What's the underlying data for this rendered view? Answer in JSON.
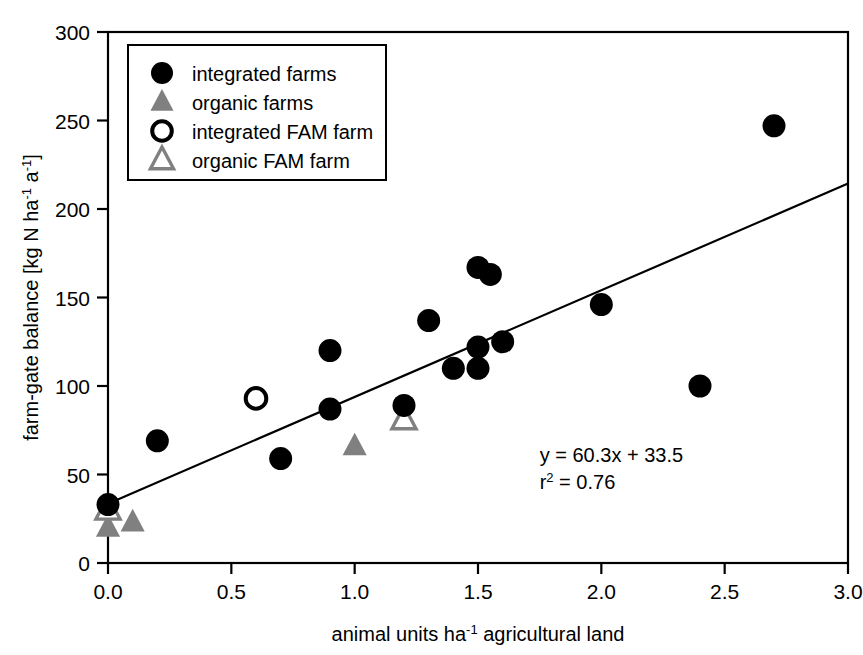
{
  "chart_data": {
    "type": "scatter",
    "title": "",
    "xlabel": "animal units ha⁻¹ agricultural land",
    "ylabel": "farm-gate balance [kg N ha⁻¹ a⁻¹]",
    "xlim": [
      0.0,
      3.0
    ],
    "ylim": [
      0,
      300
    ],
    "xticks": [
      "0.0",
      "0.5",
      "1.0",
      "1.5",
      "2.0",
      "2.5",
      "3.0"
    ],
    "xtick_values": [
      0.0,
      0.5,
      1.0,
      1.5,
      2.0,
      2.5,
      3.0
    ],
    "yticks": [
      "0",
      "50",
      "100",
      "150",
      "200",
      "250",
      "300"
    ],
    "ytick_values": [
      0,
      50,
      100,
      150,
      200,
      250,
      300
    ],
    "grid": false,
    "legend_position": "top-left",
    "legend": [
      {
        "label": "integrated farms",
        "marker": "filled-circle",
        "color": "#000000"
      },
      {
        "label": "organic farms",
        "marker": "filled-triangle",
        "color": "#808080"
      },
      {
        "label": "integrated FAM farm",
        "marker": "open-circle",
        "color": "#000000"
      },
      {
        "label": "organic FAM farm",
        "marker": "open-triangle",
        "color": "#808080"
      }
    ],
    "annotations": [
      {
        "text": "y = 60.3x + 33.5",
        "x": 1.75,
        "y": 57
      },
      {
        "text": "r² = 0.76",
        "x": 1.75,
        "y": 42
      }
    ],
    "trendline": {
      "equation": "y = 60.3x + 33.5",
      "r_squared": 0.76,
      "slope": 60.3,
      "intercept": 33.5,
      "x_start": 0.0,
      "y_start": 33.5,
      "x_end": 3.0,
      "y_end": 214.4,
      "color": "#000000"
    },
    "series": [
      {
        "name": "integrated farms",
        "marker": "filled-circle",
        "color": "#000000",
        "points": [
          {
            "x": 0.0,
            "y": 33
          },
          {
            "x": 0.2,
            "y": 69
          },
          {
            "x": 0.7,
            "y": 59
          },
          {
            "x": 0.9,
            "y": 120
          },
          {
            "x": 0.9,
            "y": 87
          },
          {
            "x": 1.2,
            "y": 89
          },
          {
            "x": 1.3,
            "y": 137
          },
          {
            "x": 1.4,
            "y": 110
          },
          {
            "x": 1.5,
            "y": 167
          },
          {
            "x": 1.5,
            "y": 122
          },
          {
            "x": 1.5,
            "y": 110
          },
          {
            "x": 1.55,
            "y": 163
          },
          {
            "x": 1.6,
            "y": 125
          },
          {
            "x": 2.0,
            "y": 146
          },
          {
            "x": 2.4,
            "y": 100
          },
          {
            "x": 2.7,
            "y": 247
          }
        ]
      },
      {
        "name": "organic farms",
        "marker": "filled-triangle",
        "color": "#808080",
        "points": [
          {
            "x": 0.0,
            "y": 20
          },
          {
            "x": 0.1,
            "y": 23
          },
          {
            "x": 1.0,
            "y": 66
          }
        ]
      },
      {
        "name": "integrated FAM farm",
        "marker": "open-circle",
        "color": "#000000",
        "points": [
          {
            "x": 0.6,
            "y": 93
          }
        ]
      },
      {
        "name": "organic FAM farm",
        "marker": "open-triangle",
        "color": "#808080",
        "points": [
          {
            "x": 0.0,
            "y": 30
          },
          {
            "x": 1.2,
            "y": 81
          }
        ]
      }
    ]
  },
  "axis": {
    "x_label_main": "animal units ha",
    "x_label_sup": "-1",
    "x_label_tail": " agricultural land",
    "y_label_p1": "farm-gate balance [kg N ha",
    "y_label_sup1": "-1",
    "y_label_p2": " a",
    "y_label_sup2": "-1",
    "y_label_p3": "]"
  },
  "annotation_lines": {
    "eq_prefix": "y = 60.3x + 33.5",
    "r_base": "r",
    "r_sup": "2",
    "r_rest": " = 0.76"
  }
}
